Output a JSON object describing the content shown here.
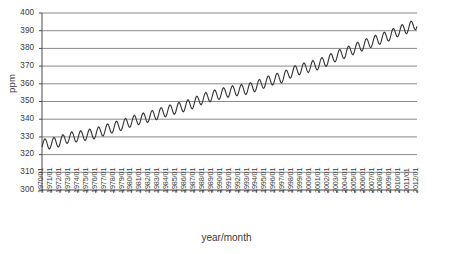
{
  "chart_data": {
    "type": "line",
    "title": "",
    "xlabel": "year/month",
    "ylabel": "ppm",
    "ylim": [
      300,
      400
    ],
    "yticks": [
      300,
      310,
      320,
      330,
      340,
      350,
      360,
      370,
      380,
      390,
      400
    ],
    "grid": true,
    "legend": "none",
    "line_color": "#333333",
    "x_tick_labels": [
      "1970/01",
      "1971/01",
      "1972/01",
      "1973/01",
      "1974/01",
      "1975/01",
      "1976/01",
      "1977/01",
      "1978/01",
      "1979/01",
      "1980/01",
      "1981/01",
      "1982/01",
      "1983/01",
      "1984/01",
      "1985/01",
      "1986/01",
      "1987/01",
      "1988/01",
      "1989/01",
      "1990/01",
      "1991/01",
      "1992/01",
      "1993/01",
      "1994/01",
      "1995/01",
      "1996/01",
      "1997/01",
      "1998/01",
      "1999/01",
      "2000/01",
      "2001/01",
      "2002/01",
      "2003/01",
      "2004/01",
      "2005/01",
      "2006/01",
      "2007/01",
      "2008/01",
      "2009/01",
      "2010/01",
      "2011/01",
      "2012/01"
    ],
    "x_start": "1970/01",
    "x_end": "2012/01",
    "series": [
      {
        "name": "CO2 concentration",
        "annual_mean_values": [
          325.7,
          326.3,
          327.5,
          329.7,
          330.2,
          331.1,
          332.0,
          333.8,
          335.4,
          336.8,
          338.7,
          340.1,
          341.4,
          343.0,
          344.6,
          346.0,
          347.4,
          349.2,
          351.6,
          353.1,
          354.4,
          355.6,
          356.4,
          357.1,
          358.8,
          360.8,
          362.6,
          363.7,
          366.7,
          368.4,
          369.6,
          371.1,
          373.2,
          375.8,
          377.5,
          379.8,
          381.9,
          383.8,
          385.6,
          387.4,
          389.9,
          391.6,
          393.9
        ],
        "seasonal_amplitude": 3.0,
        "seasonal_peak_month": 5,
        "frequency": "monthly",
        "first_value": 325.5,
        "last_value": 395.0,
        "units": "ppm"
      }
    ]
  },
  "axis": {
    "y_title": "ppm",
    "x_title": "year/month"
  }
}
